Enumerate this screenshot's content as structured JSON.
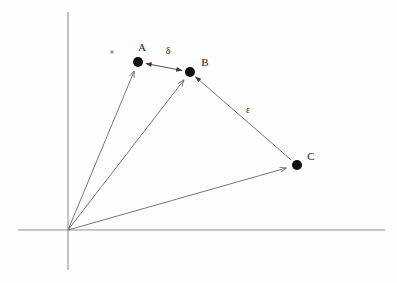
{
  "figure": {
    "title": "",
    "background_color": "#fefefe",
    "axis_color": "#8d8d8d",
    "vector_color": "#6f6f6f",
    "point_color": "#111111",
    "label_color": "#1a1a1a",
    "width": 397,
    "height": 283
  },
  "axes": {
    "origin": {
      "x": 68,
      "y": 230,
      "label": ""
    },
    "x_axis": {
      "x1": 18,
      "y1": 230,
      "x2": 385,
      "y2": 230,
      "name": "horizontal-axis"
    },
    "y_axis": {
      "x1": 68,
      "y1": 12,
      "x2": 68,
      "y2": 270,
      "name": "vertical-axis"
    }
  },
  "chart_data": {
    "type": "scatter",
    "title": "",
    "xlabel": "",
    "ylabel": "",
    "grid": false,
    "legend": "none",
    "origin_px": [
      68,
      230
    ],
    "points": [
      {
        "id": "A",
        "label": "A",
        "x_px": 138,
        "y_px": 62,
        "label_x_px": 142,
        "label_y_px": 47,
        "radius_px": 5
      },
      {
        "id": "B",
        "label": "B",
        "x_px": 190,
        "y_px": 72,
        "label_x_px": 205,
        "label_y_px": 62,
        "radius_px": 5
      },
      {
        "id": "C",
        "label": "C",
        "x_px": 297,
        "y_px": 165,
        "label_x_px": 311,
        "label_y_px": 156,
        "radius_px": 5
      }
    ],
    "position_vectors": [
      {
        "id": "OA",
        "from": "origin",
        "to": "A",
        "label": "",
        "arrowhead": "at-tip"
      },
      {
        "id": "OB",
        "from": "origin",
        "to": "B",
        "label": "",
        "arrowhead": "at-tip"
      },
      {
        "id": "OC",
        "from": "origin",
        "to": "C",
        "label": "",
        "arrowhead": "at-tip"
      }
    ],
    "difference_vectors": [
      {
        "id": "delta",
        "label": "δ",
        "from": "B",
        "to": "A",
        "arrowhead": "both-ends",
        "label_x_px": 168,
        "label_y_px": 51
      },
      {
        "id": "epsilon",
        "label": "ε",
        "from": "C",
        "to": "B",
        "arrowhead": "at-tip",
        "label_x_px": 248,
        "label_y_px": 110
      }
    ],
    "artifacts": [
      {
        "id": "speck",
        "x_px": 112,
        "y_px": 52,
        "name": "scan-speck"
      }
    ]
  },
  "labels": {
    "point_a": "A",
    "point_b": "B",
    "point_c": "C",
    "vector_delta": "δ",
    "vector_epsilon": "ε"
  }
}
